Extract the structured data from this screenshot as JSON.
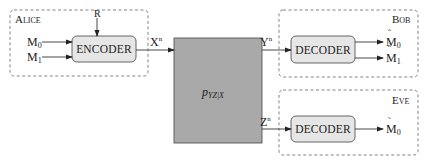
{
  "diagram": {
    "type": "wiretap broadcast channel block diagram",
    "colors": {
      "party_border": "#777777",
      "processor_fill": "#e6e6e6",
      "channel_fill": "#a9a9a9",
      "wire": "#333333"
    },
    "alice": {
      "label": "Alice",
      "randomness": "R",
      "inputs": [
        {
          "base": "M",
          "sub": "0"
        },
        {
          "base": "M",
          "sub": "1"
        }
      ],
      "encoder_label": "ENCODER"
    },
    "channel": {
      "input": {
        "base": "X",
        "sup": "n"
      },
      "label_base": "p",
      "label_sub": "YZ|X",
      "outputs": [
        {
          "base": "Y",
          "sup": "n"
        },
        {
          "base": "Z",
          "sup": "n"
        }
      ]
    },
    "bob": {
      "label": "Bob",
      "decoder_label": "DECODER",
      "outputs": [
        {
          "base": "M",
          "sub": "0",
          "accent": "ˆ"
        },
        {
          "base": "M",
          "sub": "1",
          "accent": "ˆ"
        }
      ]
    },
    "eve": {
      "label": "Eve",
      "decoder_label": "DECODER",
      "outputs": [
        {
          "base": "M",
          "sub": "0",
          "accent": "˜"
        }
      ]
    }
  }
}
